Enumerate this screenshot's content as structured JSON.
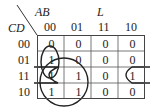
{
  "kmap": {
    "row_var": "CD",
    "col_var": "AB",
    "function_name": "L",
    "col_headers": [
      "00",
      "01",
      "11",
      "10"
    ],
    "row_headers": [
      "00",
      "01",
      "11",
      "10"
    ],
    "cells": [
      [
        "0",
        "0",
        "0",
        "0"
      ],
      [
        "1",
        "0",
        "0",
        "0"
      ],
      [
        "1",
        "1",
        "0",
        "1"
      ],
      [
        "1",
        "1",
        "0",
        "0"
      ]
    ],
    "groupings": [
      {
        "name": "vertical-oval-col00-rows01-11",
        "cells": [
          [
            1,
            0
          ],
          [
            2,
            0
          ]
        ]
      },
      {
        "name": "circle-quad-cols00-01-rows11-10",
        "cells": [
          [
            2,
            0
          ],
          [
            2,
            1
          ],
          [
            3,
            0
          ],
          [
            3,
            1
          ]
        ]
      },
      {
        "name": "wraparound-row11-cols00-10",
        "cells": [
          [
            2,
            0
          ],
          [
            2,
            3
          ]
        ]
      }
    ],
    "colors": {
      "line": "#222222",
      "grid": "#444444",
      "background": "#ffffff"
    }
  }
}
